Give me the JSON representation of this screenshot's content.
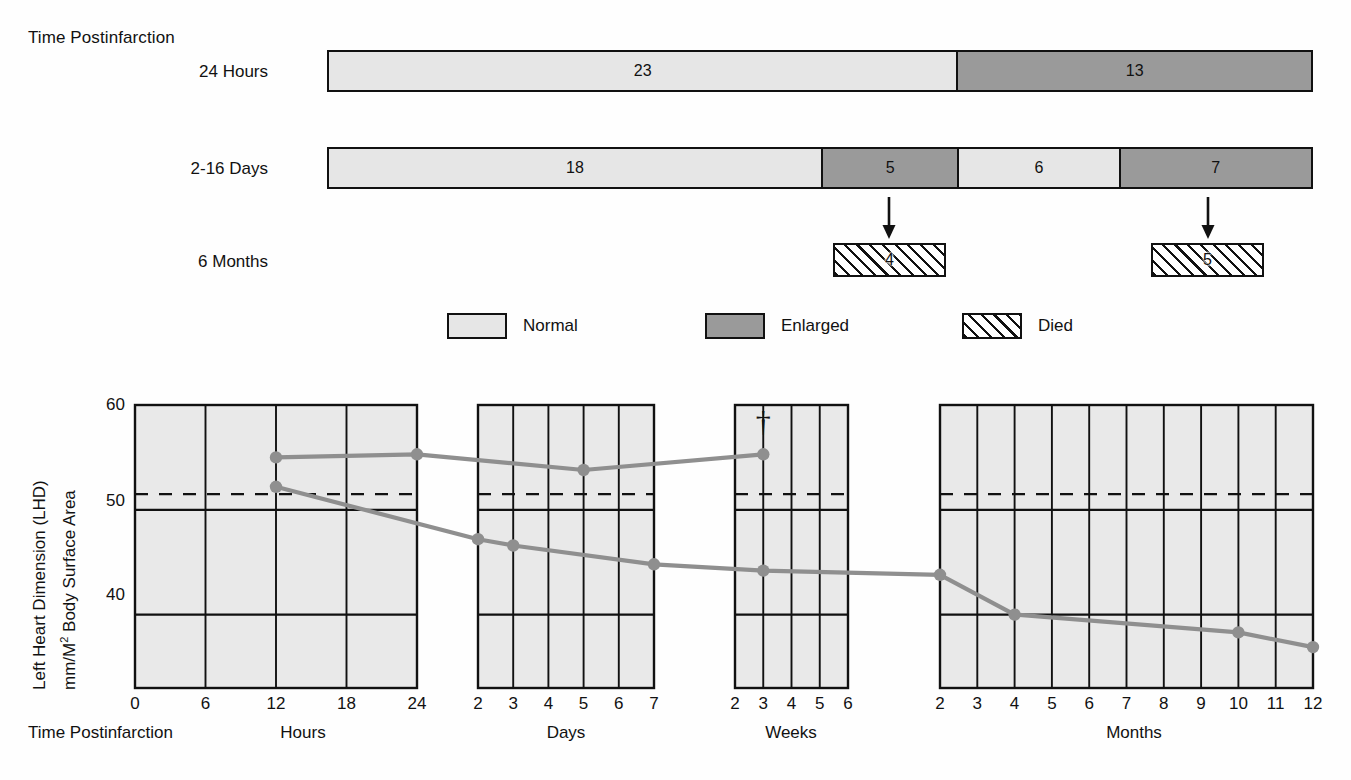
{
  "flow": {
    "header_label": "Time Postinfarction",
    "rows": [
      {
        "label": "24 Hours",
        "segments": [
          {
            "value": "23",
            "kind": "normal",
            "count": 23
          },
          {
            "value": "13",
            "kind": "enlarged",
            "count": 13
          }
        ]
      },
      {
        "label": "2-16 Days",
        "segments": [
          {
            "value": "18",
            "kind": "normal",
            "count": 18
          },
          {
            "value": "5",
            "kind": "enlarged",
            "count": 5
          },
          {
            "value": "6",
            "kind": "normal",
            "count": 6
          },
          {
            "value": "7",
            "kind": "enlarged",
            "count": 7
          }
        ]
      },
      {
        "label": "6 Months",
        "died_boxes": [
          {
            "value": "4",
            "count": 4
          },
          {
            "value": "5",
            "count": 5
          }
        ]
      }
    ]
  },
  "legend": {
    "items": [
      {
        "label": "Normal",
        "swatch": "normal",
        "color": "#e6e6e6"
      },
      {
        "label": "Enlarged",
        "swatch": "enlarged",
        "color": "#9a9a9a"
      },
      {
        "label": "Died",
        "swatch": "died",
        "color": "#ffffff"
      }
    ]
  },
  "chart_data": {
    "type": "line",
    "title": "",
    "ylabel_line1": "Left Heart Dimension (LHD)",
    "ylabel_line2": "mm/M2 Body Surface Area",
    "xlabel": "Time Postinfarction",
    "ylim": [
      33,
      60
    ],
    "yticks": [
      "60",
      "50",
      "40"
    ],
    "ytick_values": [
      60,
      50,
      40
    ],
    "gridlines_y": [
      50,
      40
    ],
    "reference_line": {
      "value": 51.5,
      "style": "dashed",
      "label": ""
    },
    "grid": true,
    "legend_position": "none",
    "annotations": [
      {
        "text": "†",
        "panel": "Weeks",
        "x": 3,
        "y": 57.5,
        "name": "death-dagger"
      }
    ],
    "panels": [
      {
        "name": "Hours",
        "ticks": [
          0,
          6,
          12,
          18,
          24
        ],
        "tick_labels": [
          "0",
          "6",
          "12",
          "18",
          "24"
        ]
      },
      {
        "name": "Days",
        "ticks": [
          2,
          3,
          4,
          5,
          6,
          7
        ],
        "tick_labels": [
          "2",
          "3",
          "4",
          "5",
          "6",
          "7"
        ]
      },
      {
        "name": "Weeks",
        "ticks": [
          2,
          3,
          4,
          5,
          6
        ],
        "tick_labels": [
          "2",
          "3",
          "4",
          "5",
          "6"
        ]
      },
      {
        "name": "Months",
        "ticks": [
          2,
          3,
          4,
          5,
          6,
          7,
          8,
          9,
          10,
          11,
          12
        ],
        "tick_labels": [
          "2",
          "3",
          "4",
          "5",
          "6",
          "7",
          "8",
          "9",
          "10",
          "11",
          "12"
        ]
      }
    ],
    "series": [
      {
        "name": "Enlarged",
        "color": "#8f8f8f",
        "points": [
          {
            "panel": "Hours",
            "x": 12,
            "y": 55.0
          },
          {
            "panel": "Hours",
            "x": 24,
            "y": 55.3
          },
          {
            "panel": "Days",
            "x": 5,
            "y": 53.8
          },
          {
            "panel": "Weeks",
            "x": 3,
            "y": 55.3
          }
        ]
      },
      {
        "name": "Normal",
        "color": "#8f8f8f",
        "points": [
          {
            "panel": "Hours",
            "x": 12,
            "y": 52.2
          },
          {
            "panel": "Days",
            "x": 2,
            "y": 47.2
          },
          {
            "panel": "Days",
            "x": 3,
            "y": 46.6
          },
          {
            "panel": "Days",
            "x": 7,
            "y": 44.8
          },
          {
            "panel": "Weeks",
            "x": 3,
            "y": 44.2
          },
          {
            "panel": "Months",
            "x": 2,
            "y": 43.8
          },
          {
            "panel": "Months",
            "x": 4,
            "y": 40.0
          },
          {
            "panel": "Months",
            "x": 10,
            "y": 38.3
          },
          {
            "panel": "Months",
            "x": 12,
            "y": 36.9
          }
        ]
      }
    ]
  }
}
